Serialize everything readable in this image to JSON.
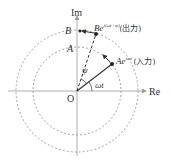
{
  "diagram": {
    "axes": {
      "real_label": "Re",
      "imag_label": "Im",
      "origin_label": "O"
    },
    "circles": {
      "inner_label": "A",
      "outer_label": "B"
    },
    "vectors": {
      "input": {
        "base": "Ae",
        "exponent": "iωt",
        "note": "(入力)"
      },
      "output": {
        "base": "Be",
        "exponent": "i(ωt+ψ)",
        "note": "(出力)"
      }
    },
    "angles": {
      "input_angle": "ωt",
      "phase_shift": "ψ"
    },
    "colors": {
      "line": "#333333",
      "dashed_circle": "#888888",
      "axis": "#999999"
    }
  }
}
